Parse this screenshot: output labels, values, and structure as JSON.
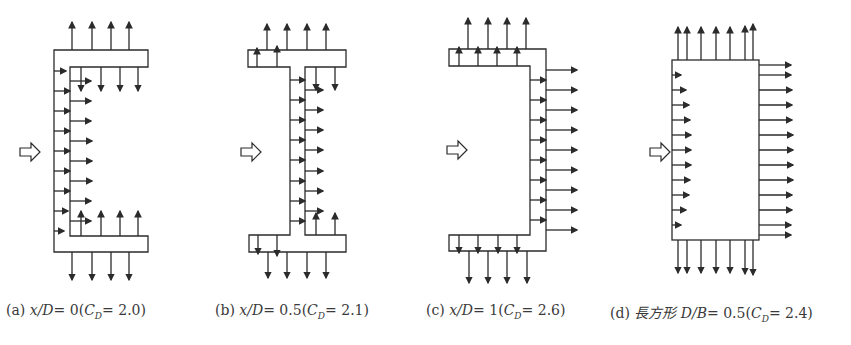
{
  "figure": {
    "flow_direction_symbol": "hollow-right-arrow",
    "line_color": "#2b2b2b",
    "panels": [
      {
        "id": "a",
        "label_prefix": "(a)",
        "param_text": "x/D",
        "param_value": "= 0",
        "cd_symbol": "C",
        "cd_sub": "D",
        "cd_value": "= 2.0",
        "shape": "channel-section opening right, web at front"
      },
      {
        "id": "b",
        "label_prefix": "(b)",
        "param_text": "x/D",
        "param_value": "= 0.5",
        "cd_symbol": "C",
        "cd_sub": "D",
        "cd_value": "= 2.1",
        "shape": "I-section, web at mid-depth"
      },
      {
        "id": "c",
        "label_prefix": "(c)",
        "param_text": "x/D",
        "param_value": "= 1",
        "cd_symbol": "C",
        "cd_sub": "D",
        "cd_value": "= 2.6",
        "shape": "channel-section opening left, web at rear"
      },
      {
        "id": "d",
        "label_prefix": "(d)",
        "param_text": "長方形 D/B",
        "param_value": "= 0.5",
        "cd_symbol": "C",
        "cd_sub": "D",
        "cd_value": "= 2.4",
        "shape": "rectangle"
      }
    ]
  }
}
